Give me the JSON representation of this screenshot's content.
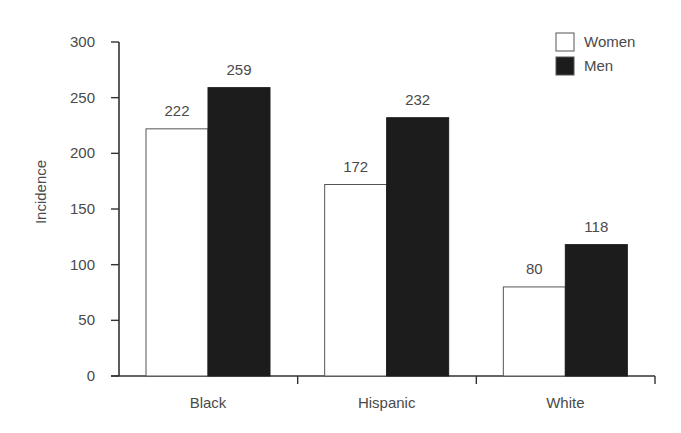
{
  "chart_data": {
    "type": "bar",
    "title": "",
    "xlabel": "",
    "ylabel": "Incidence",
    "ylim": [
      0,
      300
    ],
    "yticks": [
      0,
      50,
      100,
      150,
      200,
      250,
      300
    ],
    "grid": false,
    "legend_position": "top-right",
    "categories": [
      "Black",
      "Hispanic",
      "White"
    ],
    "series": [
      {
        "name": "Women",
        "values": [
          222,
          172,
          80
        ],
        "fill": "#ffffff",
        "stroke": "#555555"
      },
      {
        "name": "Men",
        "values": [
          259,
          232,
          118
        ],
        "fill": "#1c1c1c",
        "stroke": "#1c1c1c"
      }
    ],
    "data_labels": true
  },
  "legend": {
    "items": [
      {
        "label": "Women",
        "swatch": "#ffffff"
      },
      {
        "label": "Men",
        "swatch": "#1c1c1c"
      }
    ]
  },
  "colors": {
    "axis": "#333333",
    "text": "#4a4a4a",
    "women_fill": "#ffffff",
    "men_fill": "#1c1c1c"
  }
}
